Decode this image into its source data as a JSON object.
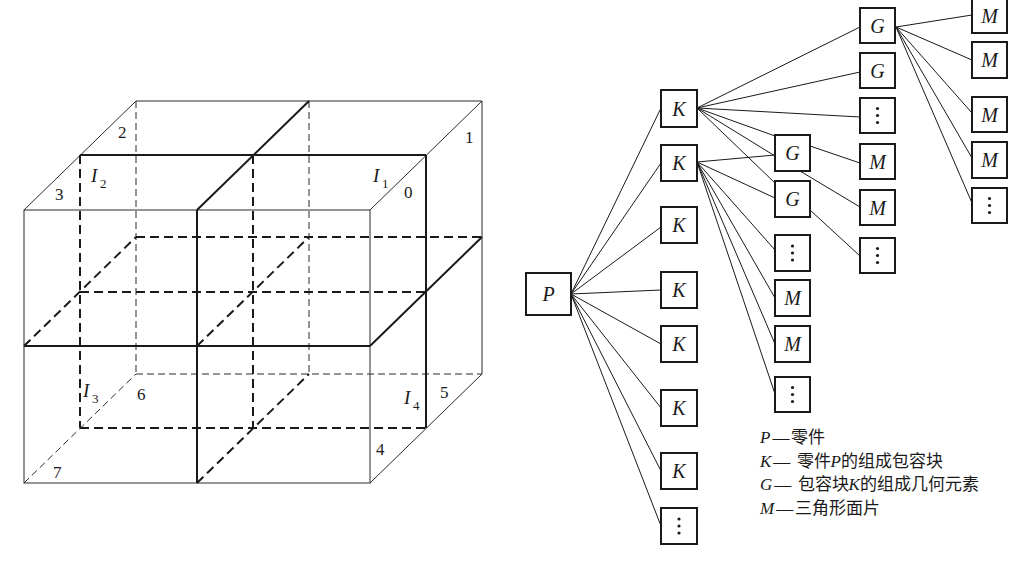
{
  "cube": {
    "vertex_labels": [
      {
        "text": "0",
        "x": 404,
        "y": 198
      },
      {
        "text": "1",
        "x": 465,
        "y": 143
      },
      {
        "text": "2",
        "x": 118,
        "y": 138
      },
      {
        "text": "3",
        "x": 55,
        "y": 200
      },
      {
        "text": "4",
        "x": 376,
        "y": 455
      },
      {
        "text": "5",
        "x": 440,
        "y": 398
      },
      {
        "text": "6",
        "x": 137,
        "y": 400
      },
      {
        "text": "7",
        "x": 53,
        "y": 478
      }
    ],
    "octant_labels": [
      {
        "main": "I",
        "sub": "1",
        "x": 373,
        "y": 182
      },
      {
        "main": "I",
        "sub": "2",
        "x": 91,
        "y": 182
      },
      {
        "main": "I",
        "sub": "3",
        "x": 83,
        "y": 397
      },
      {
        "main": "I",
        "sub": "4",
        "x": 404,
        "y": 404
      }
    ]
  },
  "tree": {
    "root": {
      "id": "P",
      "label": "P",
      "x": 526,
      "y": 273,
      "w": 45,
      "h": 42
    },
    "nodes": [
      {
        "id": "k1",
        "label": "K",
        "x": 661,
        "y": 90,
        "w": 36,
        "h": 37
      },
      {
        "id": "k2",
        "label": "K",
        "x": 661,
        "y": 145,
        "w": 36,
        "h": 36
      },
      {
        "id": "k3",
        "label": "K",
        "x": 661,
        "y": 207,
        "w": 36,
        "h": 36
      },
      {
        "id": "k4",
        "label": "K",
        "x": 661,
        "y": 272,
        "w": 36,
        "h": 36
      },
      {
        "id": "k5",
        "label": "K",
        "x": 661,
        "y": 326,
        "w": 36,
        "h": 36
      },
      {
        "id": "k6",
        "label": "K",
        "x": 661,
        "y": 390,
        "w": 36,
        "h": 36
      },
      {
        "id": "k7",
        "label": "K",
        "x": 661,
        "y": 453,
        "w": 36,
        "h": 36
      },
      {
        "id": "k8",
        "label": "⋮",
        "x": 661,
        "y": 508,
        "w": 36,
        "h": 36
      },
      {
        "id": "c2g1",
        "label": "G",
        "x": 775,
        "y": 135,
        "w": 35,
        "h": 36
      },
      {
        "id": "c2g2",
        "label": "G",
        "x": 775,
        "y": 181,
        "w": 35,
        "h": 36
      },
      {
        "id": "c2d1",
        "label": "⋮",
        "x": 775,
        "y": 235,
        "w": 35,
        "h": 36
      },
      {
        "id": "c2m1",
        "label": "M",
        "x": 775,
        "y": 280,
        "w": 35,
        "h": 36
      },
      {
        "id": "c2m2",
        "label": "M",
        "x": 775,
        "y": 326,
        "w": 35,
        "h": 36
      },
      {
        "id": "c2d2",
        "label": "⋮",
        "x": 775,
        "y": 377,
        "w": 35,
        "h": 35
      },
      {
        "id": "c3g1",
        "label": "G",
        "x": 860,
        "y": 8,
        "w": 35,
        "h": 35
      },
      {
        "id": "c3g2",
        "label": "G",
        "x": 860,
        "y": 53,
        "w": 35,
        "h": 35
      },
      {
        "id": "c3d1",
        "label": "⋮",
        "x": 860,
        "y": 98,
        "w": 35,
        "h": 35
      },
      {
        "id": "c3m1",
        "label": "M",
        "x": 860,
        "y": 144,
        "w": 35,
        "h": 35
      },
      {
        "id": "c3m2",
        "label": "M",
        "x": 860,
        "y": 190,
        "w": 35,
        "h": 35
      },
      {
        "id": "c3d2",
        "label": "⋮",
        "x": 860,
        "y": 238,
        "w": 35,
        "h": 35
      },
      {
        "id": "c4m1",
        "label": "M",
        "x": 972,
        "y": -2,
        "w": 35,
        "h": 35
      },
      {
        "id": "c4m2",
        "label": "M",
        "x": 972,
        "y": 42,
        "w": 35,
        "h": 36
      },
      {
        "id": "c4m3",
        "label": "M",
        "x": 972,
        "y": 97,
        "w": 35,
        "h": 35
      },
      {
        "id": "c4m4",
        "label": "M",
        "x": 972,
        "y": 142,
        "w": 35,
        "h": 36
      },
      {
        "id": "c4d1",
        "label": "⋮",
        "x": 972,
        "y": 188,
        "w": 35,
        "h": 35
      }
    ],
    "edges": [
      [
        571,
        294,
        661,
        108
      ],
      [
        571,
        294,
        661,
        163
      ],
      [
        571,
        294,
        661,
        227
      ],
      [
        571,
        294,
        661,
        290
      ],
      [
        571,
        294,
        661,
        344
      ],
      [
        571,
        294,
        661,
        408
      ],
      [
        571,
        294,
        661,
        471
      ],
      [
        571,
        294,
        661,
        526
      ],
      [
        697,
        108,
        860,
        27
      ],
      [
        697,
        108,
        860,
        72
      ],
      [
        697,
        108,
        860,
        117
      ],
      [
        697,
        108,
        775,
        136
      ],
      [
        697,
        108,
        775,
        156
      ],
      [
        697,
        108,
        775,
        183
      ],
      [
        697,
        162,
        775,
        155
      ],
      [
        697,
        162,
        775,
        198
      ],
      [
        697,
        162,
        775,
        250
      ],
      [
        697,
        162,
        775,
        298
      ],
      [
        697,
        162,
        775,
        344
      ],
      [
        697,
        162,
        775,
        394
      ],
      [
        810,
        146,
        860,
        163
      ],
      [
        800,
        171,
        860,
        207
      ],
      [
        810,
        210,
        860,
        256
      ],
      [
        896,
        27,
        972,
        15
      ],
      [
        896,
        27,
        972,
        60
      ],
      [
        896,
        27,
        972,
        113
      ],
      [
        896,
        27,
        972,
        158
      ],
      [
        896,
        27,
        972,
        203
      ]
    ]
  },
  "legend": [
    {
      "symbol": "P",
      "dash": "—",
      "pre": "零件",
      "mid": "",
      "post": ""
    },
    {
      "symbol": "K",
      "dash": "—",
      "pre": " 零件",
      "mid": "P",
      "post": "的组成包容块"
    },
    {
      "symbol": "G",
      "dash": "—",
      "pre": " 包容块",
      "mid": "K",
      "post": "的组成几何元素"
    },
    {
      "symbol": "M",
      "dash": "—",
      "pre": "三角形面片",
      "mid": "",
      "post": ""
    }
  ]
}
